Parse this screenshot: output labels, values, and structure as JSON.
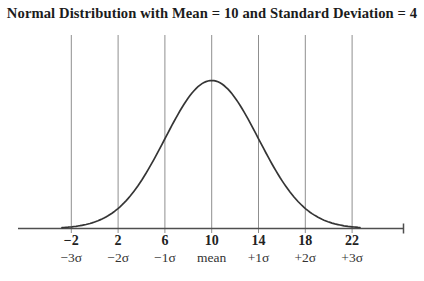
{
  "title": "Normal Distribution with Mean = 10 and Standard Deviation = 4",
  "chart_data": {
    "type": "line",
    "curve": "normal-distribution-pdf",
    "title": "Normal Distribution with Mean = 10 and Standard Deviation = 4",
    "mean": 10,
    "std_dev": 4,
    "xlabel": "",
    "ylabel": "",
    "x_range_shown": [
      -2,
      22
    ],
    "grid": "vertical lines at each sigma interval",
    "legend": "none",
    "x_ticks": [
      {
        "value": "−2",
        "sigma": "−3σ"
      },
      {
        "value": "2",
        "sigma": "−2σ"
      },
      {
        "value": "6",
        "sigma": "−1σ"
      },
      {
        "value": "10",
        "sigma": "mean"
      },
      {
        "value": "14",
        "sigma": "+1σ"
      },
      {
        "value": "18",
        "sigma": "+2σ"
      },
      {
        "value": "22",
        "sigma": "+3σ"
      }
    ]
  },
  "colors": {
    "background": "#ffffff",
    "curve": "#353535",
    "gridline": "#8f8f8f",
    "axis": "#4f4f4f",
    "title_text": "#1c1c1c",
    "tick_text": "#222222"
  }
}
